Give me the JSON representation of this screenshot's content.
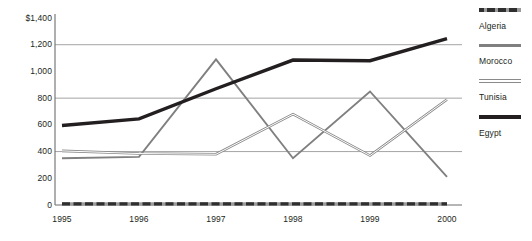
{
  "chart_data": {
    "type": "line",
    "title": "",
    "xlabel": "",
    "ylabel": "",
    "categories": [
      "1995",
      "1996",
      "1997",
      "1998",
      "1999",
      "2000"
    ],
    "ylim": [
      0,
      1400
    ],
    "yticks": [
      0,
      200,
      400,
      600,
      800,
      1000,
      1200,
      1400
    ],
    "ytick_labels": [
      "0",
      "200",
      "400",
      "600",
      "800",
      "1,000",
      "1,200",
      "$1,400"
    ],
    "gridlines": [
      400,
      800,
      1200
    ],
    "grid": true,
    "legend_position": "right",
    "series": [
      {
        "name": "Algeria",
        "color": "#2f2f2f",
        "style": "dashed",
        "width": 3.2,
        "values": [
          8,
          8,
          8,
          8,
          8,
          8
        ]
      },
      {
        "name": "Morocco",
        "color": "#808080",
        "style": "solid",
        "width": 1.9,
        "values": [
          350,
          360,
          1090,
          350,
          850,
          210
        ]
      },
      {
        "name": "Tunisia",
        "color": "#8a8a8a",
        "style": "double",
        "width": 2.6,
        "values": [
          405,
          385,
          380,
          680,
          370,
          790
        ]
      },
      {
        "name": "Egypt",
        "color": "#231f20",
        "style": "solid",
        "width": 3.4,
        "values": [
          595,
          645,
          870,
          1085,
          1080,
          1245
        ]
      }
    ]
  },
  "legend": {
    "items": [
      {
        "label": "Algeria"
      },
      {
        "label": "Morocco"
      },
      {
        "label": "Tunisia"
      },
      {
        "label": "Egypt"
      }
    ]
  },
  "axis": {
    "y_label_top": "$1,400",
    "x_first": "1995",
    "x_last": "2000"
  },
  "colors": {
    "axis": "#6d6d6d",
    "grid": "#9a9a9a",
    "text": "#231f20",
    "background": "#ffffff"
  }
}
